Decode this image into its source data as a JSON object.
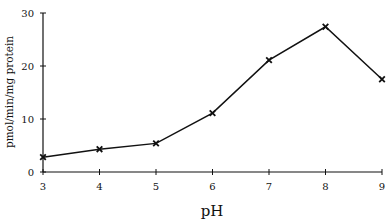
{
  "chart_data": {
    "type": "line",
    "title": "",
    "xlabel": "pH",
    "ylabel": "pmol/min/mg protein",
    "x": [
      3,
      4,
      5,
      6,
      7,
      8,
      9
    ],
    "series": [
      {
        "name": "activity",
        "values": [
          2.8,
          4.3,
          5.4,
          11.1,
          21.1,
          27.4,
          17.5
        ],
        "marker": "x"
      }
    ],
    "xlim": [
      3,
      9
    ],
    "ylim": [
      0,
      30
    ],
    "xticks": [
      "3",
      "4",
      "5",
      "6",
      "7",
      "8",
      "9"
    ],
    "yticks": [
      "0",
      "10",
      "20",
      "30"
    ],
    "grid": false,
    "legend": null
  },
  "style": {
    "line_color": "#111111"
  }
}
